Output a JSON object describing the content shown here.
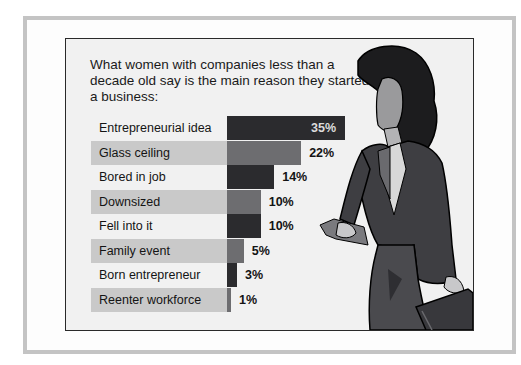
{
  "title": "What women with companies less than a decade old say is the main reason they started a business:",
  "colors": {
    "dark_bar": "#2b2b2e",
    "light_bar": "#6d6d70",
    "label_band": "#c9c9c9",
    "frame": "#c4c4c4"
  },
  "chart_data": {
    "type": "bar",
    "orientation": "horizontal",
    "title": "What women with companies less than a decade old say is the main reason they started a business:",
    "categories": [
      "Entrepreneurial idea",
      "Glass ceiling",
      "Bored in job",
      "Downsized",
      "Fell into it",
      "Family event",
      "Born entrepreneur",
      "Reenter workforce"
    ],
    "values": [
      35,
      22,
      14,
      10,
      10,
      5,
      3,
      1
    ],
    "value_labels": [
      "35%",
      "22%",
      "14%",
      "10%",
      "10%",
      "5%",
      "3%",
      "1%"
    ],
    "unit": "%",
    "xlabel": "",
    "ylabel": "",
    "grid": false,
    "legend": null
  },
  "rows": [
    {
      "label": "Entrepreneurial idea",
      "value": "35%"
    },
    {
      "label": "Glass ceiling",
      "value": "22%"
    },
    {
      "label": "Bored in job",
      "value": "14%"
    },
    {
      "label": "Downsized",
      "value": "10%"
    },
    {
      "label": "Fell into it",
      "value": "10%"
    },
    {
      "label": "Family event",
      "value": "5%"
    },
    {
      "label": "Born entrepreneur",
      "value": "3%"
    },
    {
      "label": "Reenter workforce",
      "value": "1%"
    }
  ]
}
